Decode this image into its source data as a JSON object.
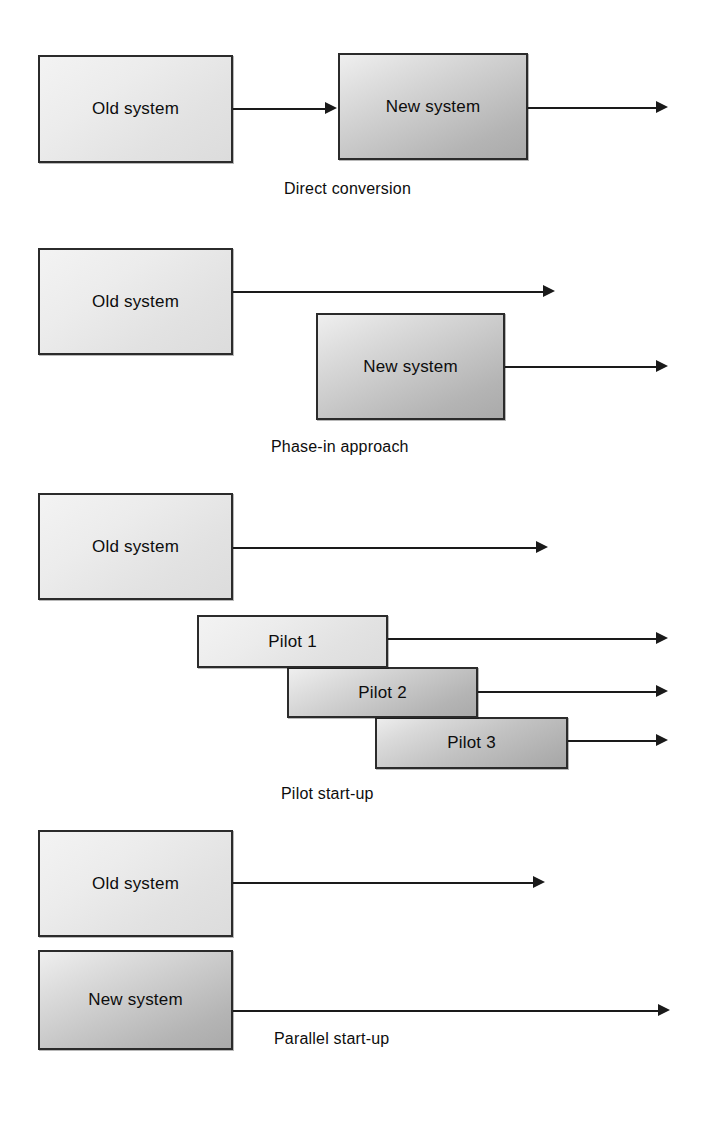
{
  "diagram": {
    "background_color": "#ffffff",
    "line_color": "#1a1a1a",
    "box_border_color": "#2b2b2b",
    "box_fill_light": "#ececec",
    "box_fill_dark": "#b4b4b4"
  },
  "sections": [
    {
      "id": "direct-conversion",
      "caption": "Direct conversion",
      "boxes": [
        {
          "id": "old-system",
          "label": "Old system",
          "shade": "light"
        },
        {
          "id": "new-system",
          "label": "New system",
          "shade": "dark"
        }
      ]
    },
    {
      "id": "phase-in-approach",
      "caption": "Phase-in approach",
      "boxes": [
        {
          "id": "old-system",
          "label": "Old system",
          "shade": "light"
        },
        {
          "id": "new-system",
          "label": "New system",
          "shade": "dark"
        }
      ]
    },
    {
      "id": "pilot-start-up",
      "caption": "Pilot start-up",
      "boxes": [
        {
          "id": "old-system",
          "label": "Old system",
          "shade": "light"
        },
        {
          "id": "pilot-1",
          "label": "Pilot 1",
          "shade": "light"
        },
        {
          "id": "pilot-2",
          "label": "Pilot 2",
          "shade": "dark"
        },
        {
          "id": "pilot-3",
          "label": "Pilot 3",
          "shade": "dark"
        }
      ]
    },
    {
      "id": "parallel-start-up",
      "caption": "Parallel start-up",
      "boxes": [
        {
          "id": "old-system",
          "label": "Old system",
          "shade": "light"
        },
        {
          "id": "new-system",
          "label": "New system",
          "shade": "dark"
        }
      ]
    }
  ]
}
